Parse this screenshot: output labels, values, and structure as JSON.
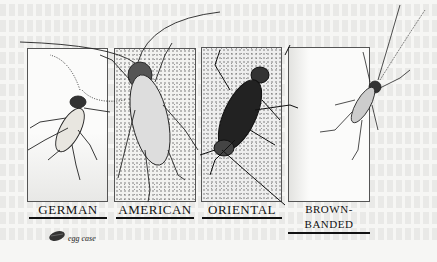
{
  "illustration": {
    "subject": "Cockroach species comparison",
    "panels": [
      {
        "label": "GERMAN"
      },
      {
        "label": "AMERICAN"
      },
      {
        "label": "ORIENTAL"
      },
      {
        "label": "BROWN-BANDED"
      }
    ],
    "legend": {
      "icon": "egg-case-icon",
      "label": "egg case"
    }
  }
}
